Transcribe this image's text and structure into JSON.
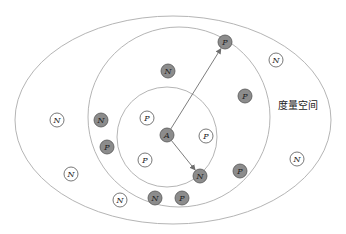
{
  "diagram": {
    "space_label": "度量空间",
    "colors": {
      "ring_stroke": "#b5b5b5",
      "filled_node": "#8c8c8c",
      "outline_node_fill": "#ffffff",
      "node_stroke": "#555555",
      "arrow": "#6e6e6e"
    },
    "regions": [
      {
        "name": "outer-ellipse",
        "cx": 173,
        "cy": 120,
        "rx": 158,
        "ry": 104
      },
      {
        "name": "middle-circle",
        "cx": 179,
        "cy": 117,
        "rx": 91,
        "ry": 90
      },
      {
        "name": "inner-circle",
        "cx": 167,
        "cy": 137,
        "rx": 50,
        "ry": 50
      }
    ],
    "anchor": {
      "label": "A",
      "x": 167,
      "y": 135,
      "filled": true
    },
    "arrows": [
      {
        "from": "A",
        "to_label": "P",
        "x": 225,
        "y": 42
      },
      {
        "from": "A",
        "to_label": "N",
        "x": 200,
        "y": 176
      }
    ],
    "nodes": [
      {
        "label": "P",
        "x": 225,
        "y": 42,
        "filled": true
      },
      {
        "label": "N",
        "x": 200,
        "y": 176,
        "filled": true
      },
      {
        "label": "N",
        "x": 168,
        "y": 71,
        "filled": true
      },
      {
        "label": "P",
        "x": 147,
        "y": 118,
        "filled": false
      },
      {
        "label": "P",
        "x": 145,
        "y": 160,
        "filled": false
      },
      {
        "label": "P",
        "x": 206,
        "y": 136,
        "filled": false
      },
      {
        "label": "N",
        "x": 101,
        "y": 120,
        "filled": true
      },
      {
        "label": "P",
        "x": 107,
        "y": 147,
        "filled": true
      },
      {
        "label": "P",
        "x": 245,
        "y": 96,
        "filled": true
      },
      {
        "label": "P",
        "x": 240,
        "y": 171,
        "filled": true
      },
      {
        "label": "N",
        "x": 155,
        "y": 198,
        "filled": true
      },
      {
        "label": "P",
        "x": 182,
        "y": 198,
        "filled": true
      },
      {
        "label": "N",
        "x": 57,
        "y": 120,
        "filled": false
      },
      {
        "label": "N",
        "x": 71,
        "y": 174,
        "filled": false
      },
      {
        "label": "N",
        "x": 120,
        "y": 200,
        "filled": false
      },
      {
        "label": "N",
        "x": 276,
        "y": 60,
        "filled": false
      },
      {
        "label": "N",
        "x": 297,
        "y": 159,
        "filled": false
      }
    ]
  }
}
